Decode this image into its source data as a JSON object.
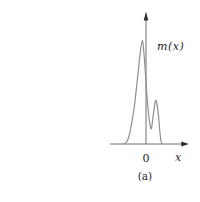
{
  "figure": {
    "function_label": "m(x)",
    "origin_label": "0",
    "x_axis_label": "x",
    "caption": "(a)"
  },
  "colors": {
    "background": "#ffffff",
    "axis": "#6e6e6e",
    "arrow": "#2f2f2f",
    "curve": "#8f8f8f",
    "text": "#1f1f1f"
  },
  "chart_data": {
    "type": "line",
    "title": "",
    "xlabel": "x",
    "ylabel": "m(x)",
    "caption": "(a)",
    "x_tick_labels": [
      "0"
    ],
    "grid": false,
    "legend": "none",
    "series": [
      {
        "name": "m(x)",
        "x_offset_px_from_origin": [
          -22,
          -19,
          -17,
          -15,
          -12,
          -9,
          -6,
          -3.7,
          -2,
          -0.4,
          1.3,
          3.3,
          5.3,
          7,
          9.4,
          11,
          12.4,
          13.8,
          15,
          16.3
        ],
        "y_fraction_of_max": [
          0,
          0.024,
          0.077,
          0.164,
          0.338,
          0.589,
          0.86,
          1.0,
          0.87,
          0.657,
          0.425,
          0.232,
          0.147,
          0.261,
          0.413,
          0.386,
          0.28,
          0.126,
          0.029,
          0.002
        ]
      }
    ],
    "pixel_points": [
      [
        124,
        144
      ],
      [
        127,
        141.5
      ],
      [
        129,
        136
      ],
      [
        131,
        127
      ],
      [
        134,
        109
      ],
      [
        137,
        83
      ],
      [
        140,
        55
      ],
      [
        142.3,
        40.5
      ],
      [
        144,
        54
      ],
      [
        145.6,
        76
      ],
      [
        147.3,
        100
      ],
      [
        149.3,
        120
      ],
      [
        151.3,
        128.8
      ],
      [
        153,
        117
      ],
      [
        155.4,
        101.3
      ],
      [
        157,
        104
      ],
      [
        158.4,
        115
      ],
      [
        159.8,
        131
      ],
      [
        161,
        141
      ],
      [
        162.3,
        143.8
      ]
    ],
    "layout_px": {
      "origin": [
        146,
        144
      ],
      "main_peak": [
        142.3,
        40.5
      ],
      "secondary_peak": [
        155.4,
        101.3
      ],
      "baseline_y": 144
    }
  }
}
